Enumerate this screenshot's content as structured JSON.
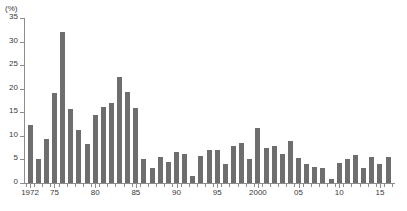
{
  "chart_data": {
    "type": "bar",
    "title": "",
    "subtitle": "",
    "unit_label": "(%)",
    "xlabel": "",
    "ylabel": "",
    "ylim": [
      0,
      35
    ],
    "yticks": [
      0,
      5,
      10,
      15,
      20,
      25,
      30,
      35
    ],
    "ytick_labels": [
      "0",
      "5",
      "10",
      "15",
      "20",
      "25",
      "30",
      "35"
    ],
    "grid": false,
    "legend": "none",
    "bar_color": "#6e6e6e",
    "axis_color": "#8c8c8c",
    "categories": [
      "1972",
      "1973",
      "1974",
      "1975",
      "1976",
      "1977",
      "1978",
      "1979",
      "1980",
      "1981",
      "1982",
      "1983",
      "1984",
      "1985",
      "1986",
      "1987",
      "1988",
      "1989",
      "1990",
      "1991",
      "1992",
      "1993",
      "1994",
      "1995",
      "1996",
      "1997",
      "1998",
      "1999",
      "2000",
      "2001",
      "2002",
      "2003",
      "2004",
      "2005",
      "2006",
      "2007",
      "2008",
      "2009",
      "2010",
      "2011",
      "2012",
      "2013",
      "2014",
      "2015",
      "2016"
    ],
    "values": [
      12.4,
      5.0,
      9.4,
      19.0,
      32.0,
      15.8,
      11.3,
      8.3,
      14.5,
      16.2,
      17.0,
      22.5,
      19.4,
      16.0,
      5.0,
      3.2,
      5.5,
      4.4,
      6.6,
      6.2,
      1.5,
      5.8,
      7.0,
      7.1,
      4.0,
      7.9,
      8.4,
      5.2,
      11.7,
      7.5,
      7.9,
      6.2,
      9.0,
      5.3,
      4.1,
      3.5,
      3.2,
      0.8,
      4.3,
      5.1,
      5.9,
      3.1,
      5.5,
      4.0,
      5.6
    ],
    "xtick_labels": [
      {
        "label": "1972",
        "category": "1972"
      },
      {
        "label": "75",
        "category": "1975"
      },
      {
        "label": "80",
        "category": "1980"
      },
      {
        "label": "85",
        "category": "1985"
      },
      {
        "label": "90",
        "category": "1990"
      },
      {
        "label": "95",
        "category": "1995"
      },
      {
        "label": "2000",
        "category": "2000"
      },
      {
        "label": "05",
        "category": "2005"
      },
      {
        "label": "10",
        "category": "2010"
      },
      {
        "label": "15",
        "category": "2015"
      }
    ]
  },
  "footnote": ""
}
